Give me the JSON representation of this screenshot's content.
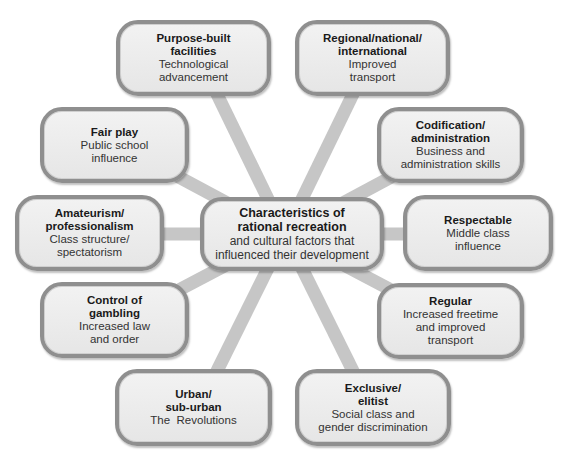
{
  "diagram": {
    "center": {
      "title_lines": [
        "Characteristics of",
        "rational recreation"
      ],
      "subtitle_lines": [
        "and cultural factors that",
        "influenced their development"
      ]
    },
    "nodes": [
      {
        "id": "purpose-built",
        "title_lines": [
          "Purpose-built",
          "facilities"
        ],
        "subtitle_lines": [
          "Technological",
          "advancement"
        ]
      },
      {
        "id": "regional",
        "title_lines": [
          "Regional/national/",
          "international"
        ],
        "subtitle_lines": [
          "Improved",
          "transport"
        ]
      },
      {
        "id": "fair-play",
        "title_lines": [
          "Fair play"
        ],
        "subtitle_lines": [
          "Public school",
          "influence"
        ]
      },
      {
        "id": "codification",
        "title_lines": [
          "Codification/",
          "administration"
        ],
        "subtitle_lines": [
          "Business and",
          "administration skills"
        ]
      },
      {
        "id": "amateurism",
        "title_lines": [
          "Amateurism/",
          "professionalism"
        ],
        "subtitle_lines": [
          "Class structure/",
          "spectatorism"
        ]
      },
      {
        "id": "respectable",
        "title_lines": [
          "Respectable"
        ],
        "subtitle_lines": [
          "Middle class",
          "influence"
        ]
      },
      {
        "id": "control-gambling",
        "title_lines": [
          "Control of",
          "gambling"
        ],
        "subtitle_lines": [
          "Increased law",
          "and order"
        ]
      },
      {
        "id": "regular",
        "title_lines": [
          "Regular"
        ],
        "subtitle_lines": [
          "Increased freetime",
          "and improved",
          "transport"
        ]
      },
      {
        "id": "urban",
        "title_lines": [
          "Urban/",
          "sub-urban"
        ],
        "subtitle_lines": [
          "The  Revolutions"
        ]
      },
      {
        "id": "exclusive",
        "title_lines": [
          "Exclusive/",
          "elitist"
        ],
        "subtitle_lines": [
          "Social class and",
          "gender discrimination"
        ]
      }
    ],
    "colors": {
      "box_fill": "#ececec",
      "box_border": "#8f8f8f",
      "spoke": "#c4c4c4",
      "text": "#222222"
    }
  }
}
